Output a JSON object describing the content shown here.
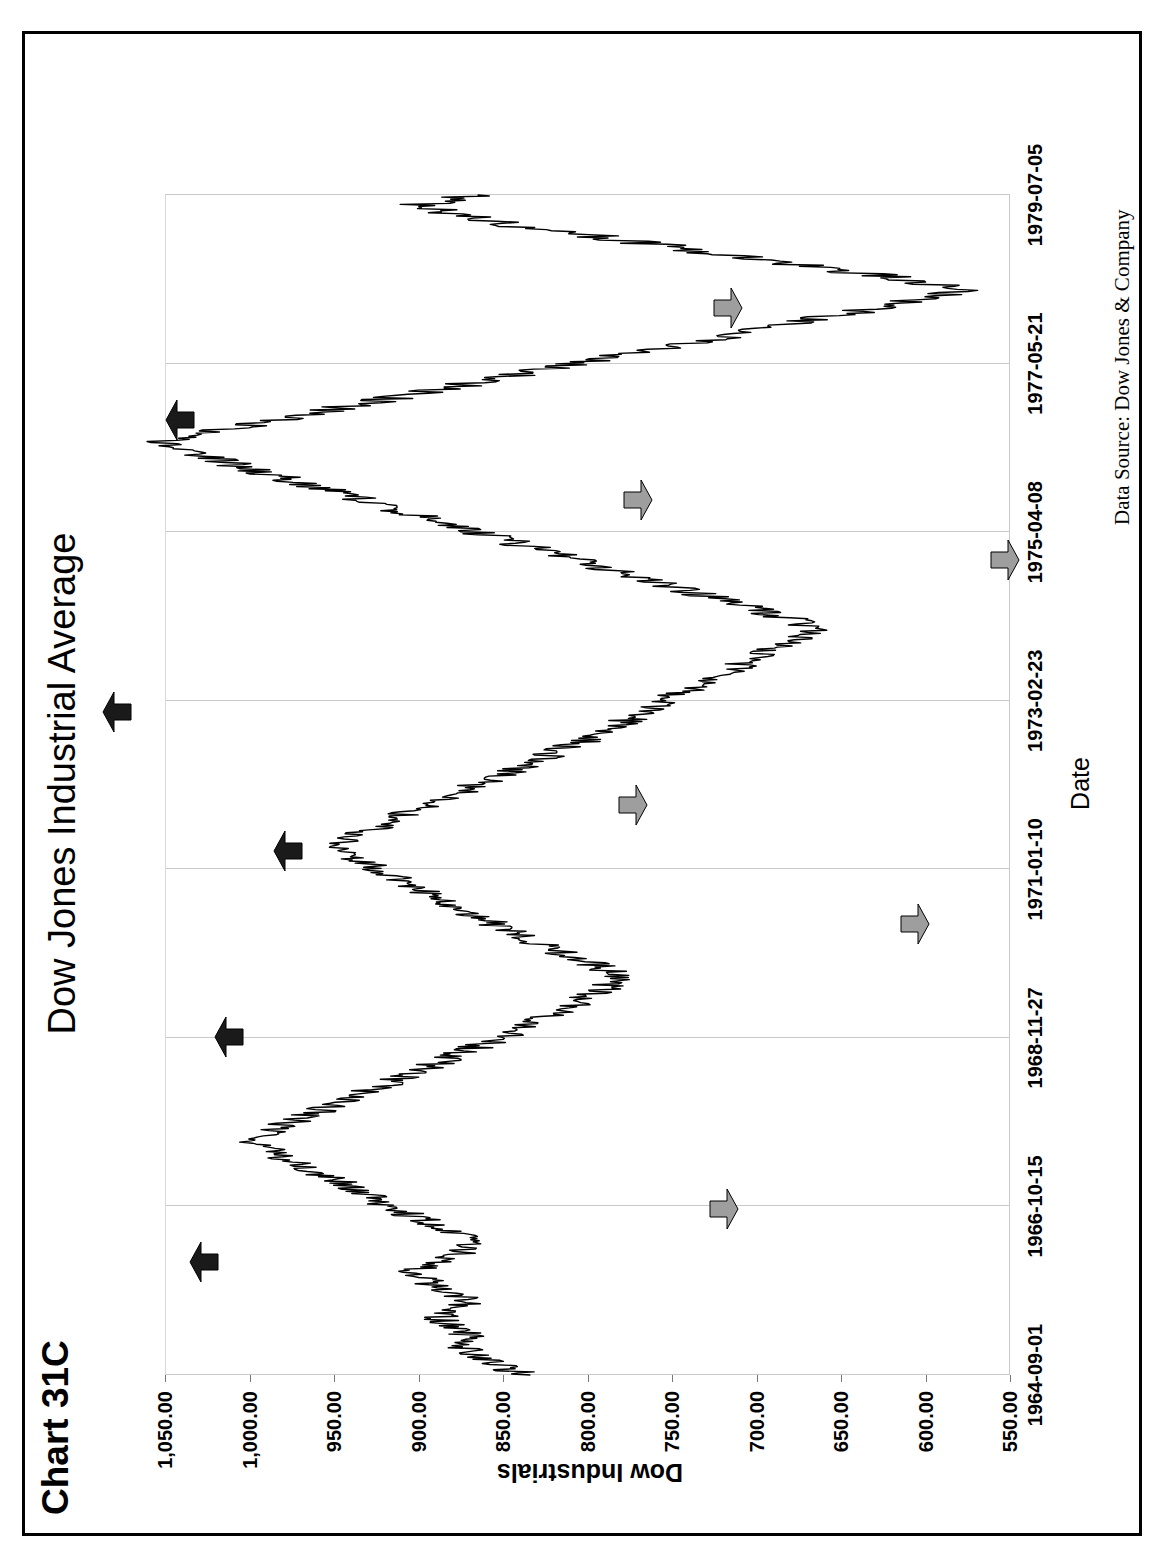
{
  "page": {
    "chart_number": "Chart 31C",
    "title": "Dow Jones Industrial Average",
    "data_source": "Data Source:  Dow Jones & Company",
    "orientation": "rotated-90-ccw",
    "frame_color": "#000000",
    "background": "#ffffff"
  },
  "chart_data": {
    "type": "line",
    "title": "Dow Jones Industrial Average",
    "xlabel": "Date",
    "ylabel": "Dow Industrials",
    "ylim": [
      550,
      1050
    ],
    "ytick_step": 50,
    "grid": true,
    "legend": null,
    "xtick_labels": [
      "1964-09-01",
      "1966-10-15",
      "1968-11-27",
      "1971-01-10",
      "1973-02-23",
      "1975-04-08",
      "1977-05-21",
      "1979-07-05"
    ],
    "ytick_labels": [
      "1,050.00",
      "1,000.00",
      "950.00",
      "900.00",
      "850.00",
      "800.00",
      "750.00",
      "700.00",
      "650.00",
      "600.00",
      "550.00"
    ],
    "ytick_values": [
      1050,
      1000,
      950,
      900,
      850,
      800,
      750,
      700,
      650,
      600,
      550
    ],
    "x_start": "1964-09-01",
    "x_end": "1979-07-05",
    "series": [
      {
        "name": "Dow Industrials",
        "color": "#000000",
        "x": [
          0.0,
          0.008,
          0.016,
          0.024,
          0.032,
          0.04,
          0.048,
          0.056,
          0.064,
          0.072,
          0.08,
          0.088,
          0.096,
          0.104,
          0.112,
          0.12,
          0.128,
          0.136,
          0.144,
          0.152,
          0.16,
          0.168,
          0.176,
          0.184,
          0.192,
          0.2,
          0.208,
          0.216,
          0.224,
          0.232,
          0.24,
          0.248,
          0.256,
          0.264,
          0.272,
          0.28,
          0.288,
          0.296,
          0.304,
          0.312,
          0.32,
          0.328,
          0.336,
          0.344,
          0.352,
          0.36,
          0.368,
          0.376,
          0.384,
          0.392,
          0.4,
          0.408,
          0.416,
          0.424,
          0.432,
          0.44,
          0.448,
          0.456,
          0.464,
          0.472,
          0.48,
          0.488,
          0.496,
          0.504,
          0.512,
          0.52,
          0.528,
          0.536,
          0.544,
          0.552,
          0.56,
          0.568,
          0.576,
          0.584,
          0.592,
          0.6,
          0.608,
          0.616,
          0.624,
          0.632,
          0.64,
          0.648,
          0.656,
          0.664,
          0.672,
          0.68,
          0.688,
          0.696,
          0.704,
          0.712,
          0.72,
          0.728,
          0.736,
          0.744,
          0.752,
          0.76,
          0.768,
          0.776,
          0.784,
          0.792,
          0.8,
          0.808,
          0.816,
          0.824,
          0.832,
          0.84,
          0.848,
          0.856,
          0.864,
          0.872,
          0.88,
          0.888,
          0.896,
          0.904,
          0.912,
          0.92,
          0.928,
          0.936,
          0.944,
          0.952,
          0.96,
          0.968,
          0.976,
          0.984,
          0.992,
          1.0
        ],
        "y": [
          838,
          850,
          862,
          874,
          869,
          880,
          888,
          876,
          868,
          884,
          895,
          903,
          890,
          875,
          868,
          880,
          893,
          905,
          918,
          930,
          942,
          955,
          968,
          980,
          990,
          1000,
          986,
          972,
          958,
          944,
          930,
          916,
          902,
          890,
          876,
          862,
          848,
          836,
          824,
          812,
          800,
          790,
          778,
          790,
          805,
          818,
          832,
          845,
          858,
          870,
          882,
          895,
          906,
          918,
          930,
          942,
          950,
          938,
          926,
          914,
          900,
          886,
          872,
          858,
          845,
          832,
          818,
          805,
          792,
          780,
          770,
          760,
          748,
          736,
          724,
          712,
          700,
          688,
          676,
          665,
          680,
          700,
          720,
          740,
          760,
          780,
          800,
          820,
          840,
          860,
          880,
          900,
          920,
          940,
          960,
          980,
          1000,
          1020,
          1040,
          1051,
          1020,
          990,
          960,
          930,
          900,
          870,
          840,
          810,
          780,
          750,
          720,
          690,
          660,
          630,
          600,
          578,
          610,
          650,
          690,
          730,
          770,
          810,
          850,
          880,
          900,
          865
        ],
        "point_count": 126
      }
    ],
    "annotations": [
      {
        "label": "peak-1966",
        "kind": "peak",
        "date": "1966-02",
        "value": 1000,
        "arrow": "black",
        "points": "right"
      },
      {
        "label": "trough-1966",
        "kind": "trough",
        "date": "1966-10",
        "value": 744,
        "arrow": "gray",
        "points": "left"
      },
      {
        "label": "peak-1968",
        "kind": "peak",
        "date": "1968-12",
        "value": 985,
        "arrow": "black",
        "points": "right"
      },
      {
        "label": "trough-1970",
        "kind": "trough",
        "date": "1970-05",
        "value": 631,
        "arrow": "gray",
        "points": "left"
      },
      {
        "label": "peak-1971",
        "kind": "peak",
        "date": "1971-04",
        "value": 950,
        "arrow": "black",
        "points": "right"
      },
      {
        "label": "trough-1971",
        "kind": "trough",
        "date": "1971-11",
        "value": 798,
        "arrow": "gray",
        "points": "left"
      },
      {
        "label": "peak-1973",
        "kind": "peak",
        "date": "1973-01",
        "value": 1051,
        "arrow": "black",
        "points": "right"
      },
      {
        "label": "trough-1974",
        "kind": "trough",
        "date": "1974-12",
        "value": 578,
        "arrow": "gray",
        "points": "left"
      },
      {
        "label": "peak-1976",
        "kind": "peak",
        "date": "1976-09",
        "value": 1014,
        "arrow": "black",
        "points": "right"
      },
      {
        "label": "trough-1975",
        "kind": "trough",
        "date": "1975-09",
        "value": 795,
        "arrow": "gray",
        "points": "left"
      },
      {
        "label": "trough-1978",
        "kind": "trough",
        "date": "1978-02",
        "value": 742,
        "arrow": "gray",
        "points": "left"
      }
    ],
    "colors": {
      "line": "#000000",
      "grid": "#c9c9c9",
      "peak_arrow": "#1a1a1a",
      "trough_arrow": "#9e9e9e"
    }
  }
}
